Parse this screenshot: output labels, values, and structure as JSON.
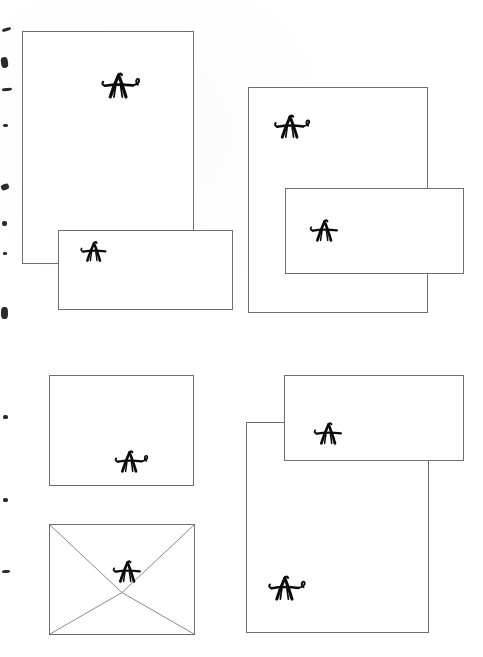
{
  "page": {
    "width": 483,
    "height": 657,
    "background_color": "#fdfdfd",
    "ink_color": "#0c0c0c",
    "rule_color": "#6f6f6f"
  },
  "monogram": {
    "letter": "A",
    "style": "hand-drawn swash capital",
    "color": "#0c0c0c"
  },
  "items": [
    {
      "id": "letterhead-portrait",
      "name": "Letterhead (portrait sheet)",
      "shape": "rectangle",
      "x": 22,
      "y": 31,
      "width": 172,
      "height": 233,
      "monogram_x": 73,
      "monogram_y": 38,
      "monogram_size": 30,
      "monogram_variant": "swash-right",
      "z": 2
    },
    {
      "id": "card-landscape-upper-left",
      "name": "Correspondence card (landscape)",
      "shape": "rectangle",
      "x": 58,
      "y": 230,
      "width": 175,
      "height": 80,
      "monogram_x": 17,
      "monogram_y": 8,
      "monogram_size": 24,
      "monogram_variant": "plain",
      "z": 3
    },
    {
      "id": "sheet-square-upper-right",
      "name": "Square sheet (upper right)",
      "shape": "rectangle",
      "x": 248,
      "y": 87,
      "width": 180,
      "height": 226,
      "monogram_x": 20,
      "monogram_y": 24,
      "monogram_size": 28,
      "monogram_variant": "swash-right",
      "z": 2
    },
    {
      "id": "card-landscape-upper-right",
      "name": "Correspondence card (landscape, overlapping)",
      "shape": "rectangle",
      "x": 285,
      "y": 188,
      "width": 179,
      "height": 86,
      "monogram_x": 19,
      "monogram_y": 28,
      "monogram_size": 26,
      "monogram_variant": "plain",
      "z": 3
    },
    {
      "id": "card-landscape-lower-left",
      "name": "Note card (landscape, monogram lower centre)",
      "shape": "rectangle",
      "x": 49,
      "y": 375,
      "width": 145,
      "height": 111,
      "monogram_x": 60,
      "monogram_y": 72,
      "monogram_size": 26,
      "monogram_variant": "swash-right",
      "z": 2
    },
    {
      "id": "envelope-lower-left",
      "name": "Envelope with flap diagonals",
      "shape": "envelope",
      "x": 49,
      "y": 524,
      "width": 146,
      "height": 111,
      "monogram_x": 58,
      "monogram_y": 33,
      "monogram_size": 26,
      "monogram_variant": "plain",
      "z": 2
    },
    {
      "id": "sheet-square-lower-right",
      "name": "Square sheet (lower right)",
      "shape": "rectangle",
      "x": 246,
      "y": 422,
      "width": 183,
      "height": 211,
      "monogram_x": 16,
      "monogram_y": 150,
      "monogram_size": 29,
      "monogram_variant": "swash-right",
      "z": 2
    },
    {
      "id": "card-landscape-lower-right",
      "name": "Correspondence card (landscape, lower right)",
      "shape": "rectangle",
      "x": 284,
      "y": 375,
      "width": 180,
      "height": 86,
      "monogram_x": 24,
      "monogram_y": 44,
      "monogram_size": 26,
      "monogram_variant": "plain",
      "z": 3
    }
  ],
  "edge_marks": [
    {
      "top": 28,
      "left": 2,
      "width": 9,
      "height": 3,
      "rotate": -18
    },
    {
      "top": 57,
      "left": 1,
      "width": 7,
      "height": 11,
      "rotate": -8
    },
    {
      "top": 88,
      "left": 2,
      "width": 10,
      "height": 3,
      "rotate": -6
    },
    {
      "top": 124,
      "left": 3,
      "width": 5,
      "height": 3,
      "rotate": 0
    },
    {
      "top": 184,
      "left": 1,
      "width": 8,
      "height": 6,
      "rotate": -22
    },
    {
      "top": 221,
      "left": 2,
      "width": 5,
      "height": 5,
      "rotate": 0
    },
    {
      "top": 252,
      "left": 3,
      "width": 4,
      "height": 3,
      "rotate": 0
    },
    {
      "top": 307,
      "left": 1,
      "width": 7,
      "height": 12,
      "rotate": 0
    },
    {
      "top": 415,
      "left": 3,
      "width": 5,
      "height": 4,
      "rotate": 0
    },
    {
      "top": 498,
      "left": 3,
      "width": 5,
      "height": 4,
      "rotate": 0
    },
    {
      "top": 570,
      "left": 2,
      "width": 8,
      "height": 3,
      "rotate": -4
    }
  ]
}
